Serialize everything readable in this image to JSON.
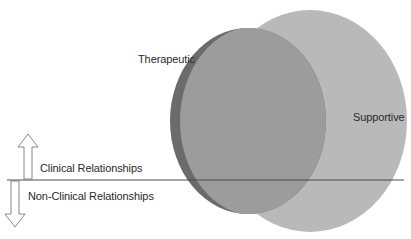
{
  "diagram": {
    "type": "venn",
    "sets": [
      {
        "id": "supportive",
        "label": "Supportive",
        "fill": "#b9b9b9",
        "shape": {
          "cx": 310,
          "cy": 121,
          "rx": 97,
          "ry": 111
        }
      },
      {
        "id": "therapeutic",
        "label": "Therapeutic",
        "fill": "#9c9c9c",
        "edge_fill": "#6b6b6b",
        "shape": {
          "cx": 248,
          "cy": 121,
          "rx": 78,
          "ry": 93
        }
      }
    ],
    "divider": {
      "y": 180,
      "x1": 7,
      "x2": 404,
      "color": "#4a4a4a"
    },
    "regions": {
      "above": {
        "label": "Clinical Relationships",
        "arrow": "up"
      },
      "below": {
        "label": "Non-Clinical Relationships",
        "arrow": "down"
      }
    }
  },
  "labels": {
    "therapeutic": "Therapeutic",
    "supportive": "Supportive",
    "clinical": "Clinical Relationships",
    "nonclinical": "Non-Clinical Relationships"
  },
  "icons": {
    "up": "arrow-up-outline",
    "down": "arrow-down-outline"
  }
}
